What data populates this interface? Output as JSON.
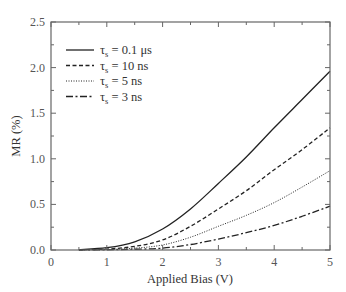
{
  "chart_data": {
    "type": "line",
    "title": "",
    "xlabel": "Applied Bias (V)",
    "ylabel": "MR (%)",
    "xlim": [
      0,
      5
    ],
    "ylim": [
      0,
      2.5
    ],
    "xticks": [
      "0",
      "1",
      "2",
      "3",
      "4",
      "5"
    ],
    "yticks": [
      "0.0",
      "0.5",
      "1.0",
      "1.5",
      "2.0",
      "2.5"
    ],
    "grid": false,
    "legend_position": "upper-left",
    "x": [
      0.5,
      1.0,
      1.5,
      2.0,
      2.5,
      3.0,
      3.5,
      4.0,
      4.5,
      5.0
    ],
    "series": [
      {
        "name": "τs = 0.1 μs",
        "symbol": "τ",
        "subscript": "s",
        "value": "= 0.1 μs",
        "style": "solid",
        "values": [
          0.005,
          0.025,
          0.09,
          0.23,
          0.45,
          0.73,
          1.02,
          1.34,
          1.65,
          1.96
        ]
      },
      {
        "name": "τs = 10 ns",
        "symbol": "τ",
        "subscript": "s",
        "value": "= 10 ns",
        "style": "dashed",
        "values": [
          0.002,
          0.01,
          0.04,
          0.11,
          0.26,
          0.45,
          0.65,
          0.88,
          1.1,
          1.34
        ]
      },
      {
        "name": "τs = 5 ns",
        "symbol": "τ",
        "subscript": "s",
        "value": "= 5 ns",
        "style": "dotted",
        "values": [
          0.001,
          0.005,
          0.02,
          0.055,
          0.14,
          0.26,
          0.38,
          0.52,
          0.69,
          0.87
        ]
      },
      {
        "name": "τs = 3 ns",
        "symbol": "τ",
        "subscript": "s",
        "value": "= 3 ns",
        "style": "dashdot",
        "values": [
          0.0,
          0.002,
          0.008,
          0.02,
          0.06,
          0.12,
          0.19,
          0.27,
          0.37,
          0.48
        ]
      }
    ]
  }
}
